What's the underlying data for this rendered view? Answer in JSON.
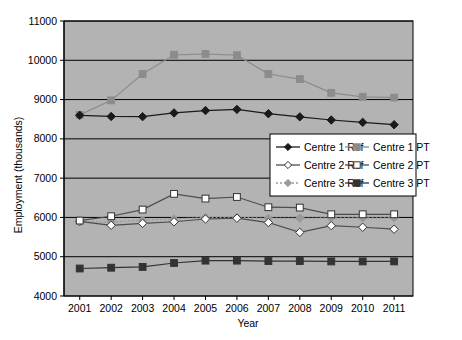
{
  "chart_data": {
    "type": "line",
    "title": "",
    "xlabel": "Year",
    "ylabel": "Employment (thousands)",
    "categories": [
      "2001",
      "2002",
      "2003",
      "2004",
      "2005",
      "2006",
      "2007",
      "2008",
      "2009",
      "2010",
      "2011"
    ],
    "x": [
      2001,
      2002,
      2003,
      2004,
      2005,
      2006,
      2007,
      2008,
      2009,
      2010,
      2011
    ],
    "xlim": [
      2000.5,
      2011.6
    ],
    "ylim": [
      4000,
      11000
    ],
    "ytick_labels": [
      "4000",
      "5000",
      "6000",
      "7000",
      "8000",
      "9000",
      "10000",
      "11000"
    ],
    "ytick_values": [
      4000,
      5000,
      6000,
      7000,
      8000,
      9000,
      10000,
      11000
    ],
    "grid": true,
    "grid_axis": "y",
    "plot_background": "#b3b3b3",
    "figure_background": "#ffffff",
    "legend_position": "inside-right-upper",
    "series": [
      {
        "name": "Centre 1 Ref",
        "marker": "diamond",
        "marker_fill": "#1a1a1a",
        "line_color": "#1a1a1a",
        "line_style": "solid",
        "values": [
          8600,
          8570,
          8565,
          8660,
          8720,
          8750,
          8640,
          8560,
          8480,
          8420,
          8360
        ]
      },
      {
        "name": "Centre 1 PT",
        "marker": "square",
        "marker_fill": "#8c8c8c",
        "line_color": "#8c8c8c",
        "line_style": "solid",
        "values": [
          8610,
          8980,
          9650,
          10140,
          10160,
          10130,
          9650,
          9520,
          9170,
          9070,
          9050
        ]
      },
      {
        "name": "Centre 2 Ref",
        "marker": "diamond",
        "marker_fill": "#ffffff",
        "line_color": "#4d4d4d",
        "line_style": "solid",
        "values": [
          5900,
          5800,
          5850,
          5890,
          5960,
          5980,
          5870,
          5620,
          5790,
          5750,
          5700
        ]
      },
      {
        "name": "Centre 2 PT",
        "marker": "square",
        "marker_fill": "#ffffff",
        "line_color": "#4d4d4d",
        "line_style": "solid",
        "values": [
          5920,
          6030,
          6200,
          6600,
          6480,
          6520,
          6260,
          6250,
          6080,
          6080,
          6080
        ]
      },
      {
        "name": "Centre 3 Ref",
        "marker": "diamond",
        "marker_fill": "#999999",
        "line_color": "#999999",
        "line_style": "dotted",
        "values": [
          5890,
          5880,
          5930,
          5960,
          6000,
          6000,
          5980,
          5980,
          5990,
          5990,
          5990
        ]
      },
      {
        "name": "Centre 3 PT",
        "marker": "square",
        "marker_fill": "#333333",
        "line_color": "#333333",
        "line_style": "solid",
        "values": [
          4700,
          4720,
          4740,
          4840,
          4900,
          4900,
          4890,
          4890,
          4880,
          4880,
          4880
        ]
      }
    ]
  },
  "legend": {
    "entries": [
      {
        "label": "Centre 1 Ref"
      },
      {
        "label": "Centre 1 PT"
      },
      {
        "label": "Centre 2 Ref"
      },
      {
        "label": "Centre 2 PT"
      },
      {
        "label": "Centre 3 Ref"
      },
      {
        "label": "Centre 3 PT"
      }
    ]
  }
}
